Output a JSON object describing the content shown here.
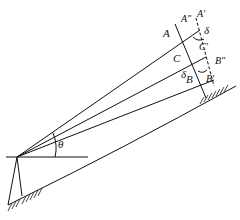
{
  "diagram": {
    "labels": {
      "A": "A",
      "A_double_prime": "A\"",
      "A_prime": "A'",
      "C": "C",
      "C_prime": "C'",
      "B": "B",
      "B_double_prime": "B\"",
      "B_prime": "B'",
      "delta_top": "δ",
      "delta_bottom": "δ",
      "theta": "θ"
    },
    "colors": {
      "ink": "#111111",
      "background": "#ffffff"
    }
  }
}
